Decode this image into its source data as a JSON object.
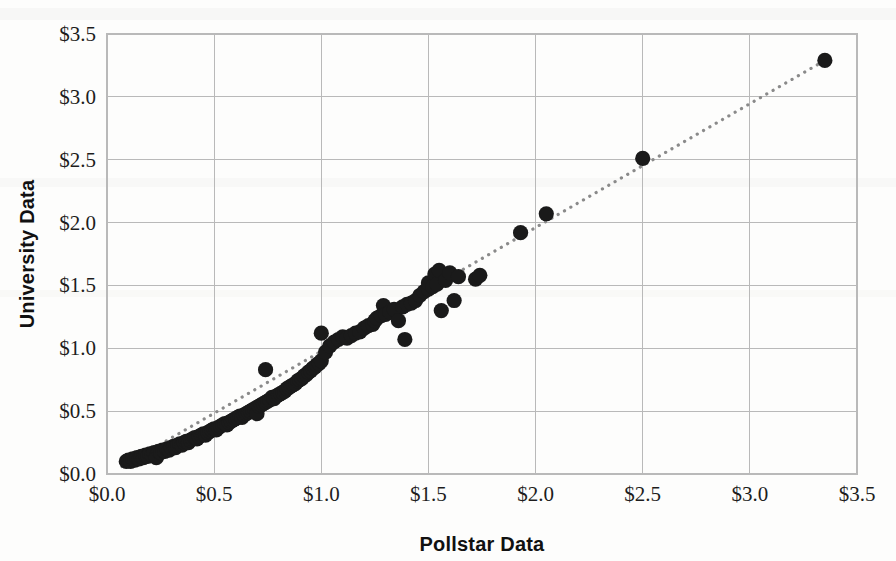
{
  "chart_data": {
    "type": "scatter",
    "title": "",
    "xlabel": "Pollstar Data",
    "ylabel": "University Data",
    "xlim": [
      0.0,
      3.5
    ],
    "ylim": [
      0.0,
      3.5
    ],
    "xticks": [
      0.0,
      0.5,
      1.0,
      1.5,
      2.0,
      2.5,
      3.0,
      3.5
    ],
    "yticks": [
      0.0,
      0.5,
      1.0,
      1.5,
      2.0,
      2.5,
      3.0,
      3.5
    ],
    "xtick_labels": [
      "$0.0",
      "$0.5",
      "$1.0",
      "$1.5",
      "$2.0",
      "$2.5",
      "$3.0",
      "$3.5"
    ],
    "ytick_labels": [
      "$0.0",
      "$0.5",
      "$1.0",
      "$1.5",
      "$2.0",
      "$2.5",
      "$3.0",
      "$3.5"
    ],
    "grid": true,
    "legend": null,
    "legend_position": "none",
    "marker_color": "#1a1a1a",
    "marker_size": 9,
    "trendline": {
      "type": "dotted-linear",
      "color": "#8a8a8a",
      "x0": 0.07,
      "y0": 0.06,
      "x1": 3.35,
      "y1": 3.29
    },
    "series": [
      {
        "name": "Venue price comparison",
        "points": [
          [
            0.09,
            0.1
          ],
          [
            0.1,
            0.11
          ],
          [
            0.11,
            0.1
          ],
          [
            0.12,
            0.12
          ],
          [
            0.13,
            0.11
          ],
          [
            0.14,
            0.13
          ],
          [
            0.15,
            0.12
          ],
          [
            0.16,
            0.14
          ],
          [
            0.17,
            0.13
          ],
          [
            0.18,
            0.15
          ],
          [
            0.19,
            0.14
          ],
          [
            0.2,
            0.16
          ],
          [
            0.21,
            0.15
          ],
          [
            0.22,
            0.17
          ],
          [
            0.23,
            0.13
          ],
          [
            0.24,
            0.18
          ],
          [
            0.25,
            0.17
          ],
          [
            0.26,
            0.19
          ],
          [
            0.27,
            0.18
          ],
          [
            0.28,
            0.2
          ],
          [
            0.29,
            0.19
          ],
          [
            0.3,
            0.21
          ],
          [
            0.31,
            0.22
          ],
          [
            0.32,
            0.21
          ],
          [
            0.33,
            0.23
          ],
          [
            0.34,
            0.24
          ],
          [
            0.35,
            0.23
          ],
          [
            0.36,
            0.25
          ],
          [
            0.37,
            0.26
          ],
          [
            0.38,
            0.25
          ],
          [
            0.39,
            0.27
          ],
          [
            0.4,
            0.28
          ],
          [
            0.41,
            0.29
          ],
          [
            0.42,
            0.28
          ],
          [
            0.43,
            0.3
          ],
          [
            0.44,
            0.31
          ],
          [
            0.45,
            0.32
          ],
          [
            0.46,
            0.31
          ],
          [
            0.47,
            0.33
          ],
          [
            0.48,
            0.34
          ],
          [
            0.49,
            0.35
          ],
          [
            0.5,
            0.36
          ],
          [
            0.51,
            0.35
          ],
          [
            0.52,
            0.37
          ],
          [
            0.53,
            0.38
          ],
          [
            0.54,
            0.39
          ],
          [
            0.55,
            0.4
          ],
          [
            0.56,
            0.39
          ],
          [
            0.57,
            0.41
          ],
          [
            0.58,
            0.42
          ],
          [
            0.59,
            0.43
          ],
          [
            0.6,
            0.44
          ],
          [
            0.61,
            0.45
          ],
          [
            0.62,
            0.46
          ],
          [
            0.63,
            0.45
          ],
          [
            0.64,
            0.47
          ],
          [
            0.65,
            0.48
          ],
          [
            0.66,
            0.49
          ],
          [
            0.67,
            0.5
          ],
          [
            0.68,
            0.51
          ],
          [
            0.69,
            0.52
          ],
          [
            0.7,
            0.53
          ],
          [
            0.7,
            0.48
          ],
          [
            0.71,
            0.54
          ],
          [
            0.72,
            0.55
          ],
          [
            0.73,
            0.56
          ],
          [
            0.74,
            0.57
          ],
          [
            0.75,
            0.58
          ],
          [
            0.74,
            0.83
          ],
          [
            0.76,
            0.59
          ],
          [
            0.77,
            0.61
          ],
          [
            0.78,
            0.6
          ],
          [
            0.79,
            0.62
          ],
          [
            0.8,
            0.63
          ],
          [
            0.81,
            0.64
          ],
          [
            0.82,
            0.65
          ],
          [
            0.83,
            0.66
          ],
          [
            0.84,
            0.68
          ],
          [
            0.85,
            0.69
          ],
          [
            0.86,
            0.7
          ],
          [
            0.87,
            0.71
          ],
          [
            0.88,
            0.72
          ],
          [
            0.89,
            0.74
          ],
          [
            0.9,
            0.75
          ],
          [
            0.91,
            0.76
          ],
          [
            0.92,
            0.78
          ],
          [
            0.93,
            0.79
          ],
          [
            0.94,
            0.81
          ],
          [
            0.95,
            0.82
          ],
          [
            0.96,
            0.84
          ],
          [
            0.97,
            0.85
          ],
          [
            0.98,
            0.87
          ],
          [
            0.99,
            0.88
          ],
          [
            1.0,
            0.9
          ],
          [
            1.0,
            1.12
          ],
          [
            1.02,
            0.97
          ],
          [
            1.04,
            1.02
          ],
          [
            1.06,
            1.05
          ],
          [
            1.08,
            1.07
          ],
          [
            1.1,
            1.09
          ],
          [
            1.12,
            1.08
          ],
          [
            1.14,
            1.1
          ],
          [
            1.16,
            1.12
          ],
          [
            1.18,
            1.13
          ],
          [
            1.2,
            1.16
          ],
          [
            1.22,
            1.18
          ],
          [
            1.24,
            1.19
          ],
          [
            1.25,
            1.22
          ],
          [
            1.26,
            1.24
          ],
          [
            1.28,
            1.26
          ],
          [
            1.29,
            1.34
          ],
          [
            1.3,
            1.27
          ],
          [
            1.32,
            1.29
          ],
          [
            1.34,
            1.31
          ],
          [
            1.36,
            1.22
          ],
          [
            1.38,
            1.33
          ],
          [
            1.39,
            1.07
          ],
          [
            1.4,
            1.35
          ],
          [
            1.42,
            1.36
          ],
          [
            1.44,
            1.38
          ],
          [
            1.46,
            1.42
          ],
          [
            1.48,
            1.45
          ],
          [
            1.5,
            1.47
          ],
          [
            1.5,
            1.52
          ],
          [
            1.52,
            1.49
          ],
          [
            1.53,
            1.59
          ],
          [
            1.54,
            1.51
          ],
          [
            1.55,
            1.62
          ],
          [
            1.56,
            1.3
          ],
          [
            1.58,
            1.54
          ],
          [
            1.6,
            1.6
          ],
          [
            1.62,
            1.38
          ],
          [
            1.64,
            1.57
          ],
          [
            1.72,
            1.55
          ],
          [
            1.74,
            1.58
          ],
          [
            1.93,
            1.92
          ],
          [
            2.05,
            2.07
          ],
          [
            2.5,
            2.51
          ],
          [
            3.35,
            3.29
          ]
        ]
      }
    ]
  },
  "axes": {
    "x_title": "Pollstar Data",
    "y_title": "University Data"
  }
}
